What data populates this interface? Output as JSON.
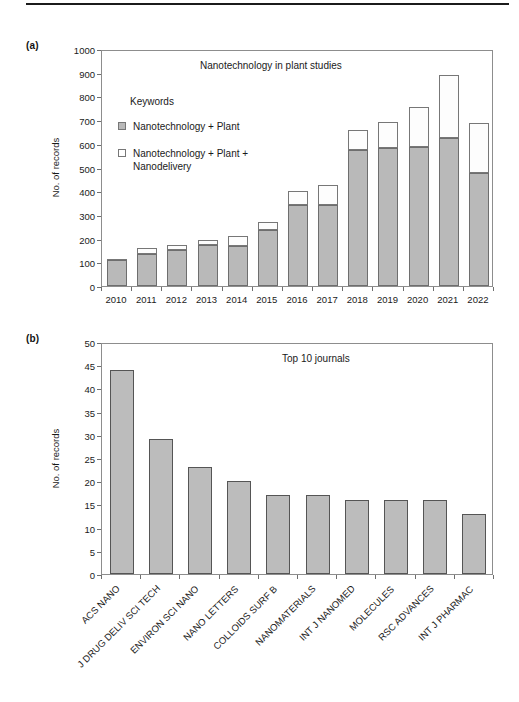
{
  "figure": {
    "panel_a_label": "(a)",
    "panel_b_label": "(b)"
  },
  "legend": {
    "heading": "Keywords",
    "items": [
      {
        "label": "Nanotechnology + Plant",
        "color": "#b9b9b9",
        "style": "filled"
      },
      {
        "label": "Nanotechnology + Plant + Nanodelivery",
        "color": "#ffffff",
        "style": "empty"
      }
    ]
  },
  "chart_data": [
    {
      "id": "panel-a",
      "type": "bar",
      "stacked": true,
      "title": "Nanotechnology in plant studies",
      "xlabel": "",
      "ylabel": "No. of records",
      "ylim": [
        0,
        1000
      ],
      "yticks": [
        0,
        100,
        200,
        300,
        400,
        500,
        600,
        700,
        800,
        900,
        1000
      ],
      "grid": false,
      "legend_position": "inside-top-left",
      "categories": [
        "2010",
        "2011",
        "2012",
        "2013",
        "2014",
        "2015",
        "2016",
        "2017",
        "2018",
        "2019",
        "2020",
        "2021",
        "2022"
      ],
      "series": [
        {
          "name": "Nanotechnology + Plant",
          "color": "#b9b9b9",
          "values": [
            110,
            133,
            153,
            171,
            170,
            235,
            341,
            340,
            572,
            582,
            586,
            624,
            476
          ]
        },
        {
          "name": "Nanotechnology + Plant + Nanodelivery",
          "color": "#ffffff",
          "values": [
            5,
            28,
            19,
            25,
            41,
            36,
            61,
            86,
            85,
            111,
            170,
            265,
            212
          ]
        }
      ],
      "totals": [
        115,
        161,
        172,
        196,
        211,
        271,
        402,
        426,
        657,
        693,
        756,
        889,
        688
      ]
    },
    {
      "id": "panel-b",
      "type": "bar",
      "stacked": false,
      "title": "Top 10 journals",
      "xlabel": "",
      "ylabel": "No. of records",
      "ylim": [
        0,
        50
      ],
      "yticks": [
        0,
        5,
        10,
        15,
        20,
        25,
        30,
        35,
        40,
        45,
        50
      ],
      "grid": false,
      "categories": [
        "ACS NANO",
        "J DRUG DELIV SCI TECH",
        "ENVIRON SCI NANO",
        "NANO LETTERS",
        "COLLOIDS SURF B",
        "NANOMATERIALS",
        "INT J NANOMED",
        "MOLECULES",
        "RSC ADVANCES",
        "INT J PHARMAC"
      ],
      "values": [
        44,
        29,
        23,
        20,
        17,
        17,
        16,
        16,
        16,
        13
      ],
      "bar_color": "#bcbcbc"
    }
  ]
}
